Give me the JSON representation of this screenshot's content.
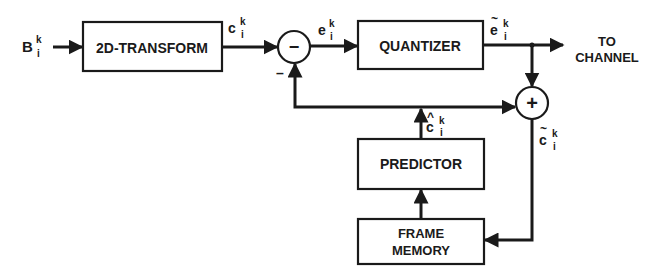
{
  "diagram": {
    "type": "block-diagram",
    "blocks": {
      "transform": "2D-TRANSFORM",
      "quantizer": "QUANTIZER",
      "predictor": "PREDICTOR",
      "frame_memory_line1": "FRAME",
      "frame_memory_line2": "MEMORY"
    },
    "nodes": {
      "subtractor_symbol": "−",
      "subtractor_minus_input": "–",
      "adder_symbol": "+"
    },
    "signals": {
      "input": {
        "base": "B",
        "sup": "k",
        "sub": "i"
      },
      "transform_out": {
        "base": "c",
        "sup": "k",
        "sub": "i"
      },
      "error": {
        "base": "e",
        "sup": "k",
        "sub": "i"
      },
      "quantized_error": {
        "base": "e",
        "accent": "~",
        "sup": "k",
        "sub": "i"
      },
      "prediction": {
        "base": "c",
        "accent": "^",
        "sup": "k",
        "sub": "i"
      },
      "reconstructed": {
        "base": "c",
        "accent": "~",
        "sup": "k",
        "sub": "i"
      }
    },
    "output_label_line1": "TO",
    "output_label_line2": "CHANNEL"
  }
}
